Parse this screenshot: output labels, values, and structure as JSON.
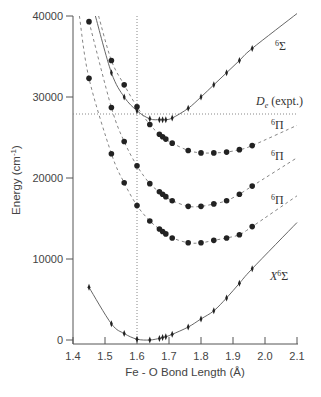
{
  "chart_data": {
    "type": "scatter",
    "title": "",
    "xlabel": "Fe - O Bond Length (Å)",
    "ylabel": "Energy (cm⁻¹)",
    "xlim": [
      1.4,
      2.1
    ],
    "ylim": [
      -500,
      40000
    ],
    "x_ticks": [
      "1.4",
      "1.5",
      "1.6",
      "1.7",
      "1.8",
      "1.9",
      "2.0",
      "2.1"
    ],
    "y_ticks": [
      "0",
      "10000",
      "20000",
      "30000",
      "40000"
    ],
    "grid": false,
    "reference_lines": [
      {
        "type": "horizontal",
        "y": 27900,
        "style": "dotted",
        "label": "De (expt.)"
      },
      {
        "type": "vertical",
        "x": 1.64,
        "style": "dotted"
      }
    ],
    "series": [
      {
        "name": "⁶Σ",
        "line": "solid",
        "marker": "diamond",
        "x": [
          1.52,
          1.56,
          1.6,
          1.64,
          1.67,
          1.68,
          1.69,
          1.71,
          1.76,
          1.8,
          1.84,
          1.88,
          1.92,
          1.96
        ],
        "y": [
          33000,
          30000,
          28300,
          27300,
          27200,
          27200,
          27200,
          27400,
          28600,
          30000,
          31500,
          33000,
          34500,
          36000
        ]
      },
      {
        "name": "⁶Π (upper)",
        "line": "dashed",
        "marker": "circle",
        "x": [
          1.52,
          1.56,
          1.6,
          1.64,
          1.67,
          1.68,
          1.69,
          1.71,
          1.76,
          1.8,
          1.84,
          1.88,
          1.92,
          1.96
        ],
        "y": [
          34500,
          31500,
          28800,
          26600,
          25400,
          25100,
          24800,
          24300,
          23400,
          23100,
          23100,
          23200,
          23500,
          24000
        ]
      },
      {
        "name": "⁶Π (middle)",
        "line": "dashed",
        "marker": "circle",
        "x": [
          1.45,
          1.52,
          1.56,
          1.6,
          1.64,
          1.67,
          1.68,
          1.69,
          1.71,
          1.76,
          1.8,
          1.84,
          1.88,
          1.92,
          1.96
        ],
        "y": [
          39300,
          28700,
          24500,
          21500,
          19300,
          18300,
          18000,
          17700,
          17200,
          16500,
          16500,
          16800,
          17200,
          18000,
          19000
        ]
      },
      {
        "name": "⁶Π (lower)",
        "line": "dashed",
        "marker": "circle",
        "x": [
          1.45,
          1.52,
          1.56,
          1.6,
          1.64,
          1.67,
          1.68,
          1.69,
          1.71,
          1.76,
          1.8,
          1.84,
          1.88,
          1.92,
          1.96
        ],
        "y": [
          32300,
          23000,
          19400,
          16600,
          14700,
          13700,
          13400,
          13100,
          12600,
          12000,
          12000,
          12300,
          12600,
          13000,
          14000
        ]
      },
      {
        "name": "X⁶Σ",
        "line": "solid",
        "marker": "diamond",
        "x": [
          1.45,
          1.52,
          1.56,
          1.6,
          1.64,
          1.67,
          1.68,
          1.69,
          1.71,
          1.76,
          1.8,
          1.84,
          1.88,
          1.92,
          1.96
        ],
        "y": [
          6500,
          2000,
          800,
          100,
          0,
          200,
          300,
          400,
          700,
          1600,
          2600,
          3600,
          5200,
          7000,
          8800
        ]
      }
    ],
    "annotations": [
      "⁶Σ",
      "De (expt.)",
      "⁶Π",
      "⁶Π",
      "⁶Π",
      "X⁶Σ"
    ]
  },
  "labels": {
    "xlabel": "Fe - O Bond Length (Å)",
    "ylabel_main": "Energy (cm",
    "ylabel_sup": "-1",
    "ylabel_end": ")",
    "sigma6": "Σ",
    "pi6": "Π",
    "sup6": "6",
    "de": "D",
    "de_sub": "e",
    "de_rest": " (expt.)",
    "xstate": "X",
    "xticks": [
      "1.4",
      "1.5",
      "1.6",
      "1.7",
      "1.8",
      "1.9",
      "2.0",
      "2.1"
    ],
    "yticks": [
      "0",
      "10000",
      "20000",
      "30000",
      "40000"
    ]
  }
}
